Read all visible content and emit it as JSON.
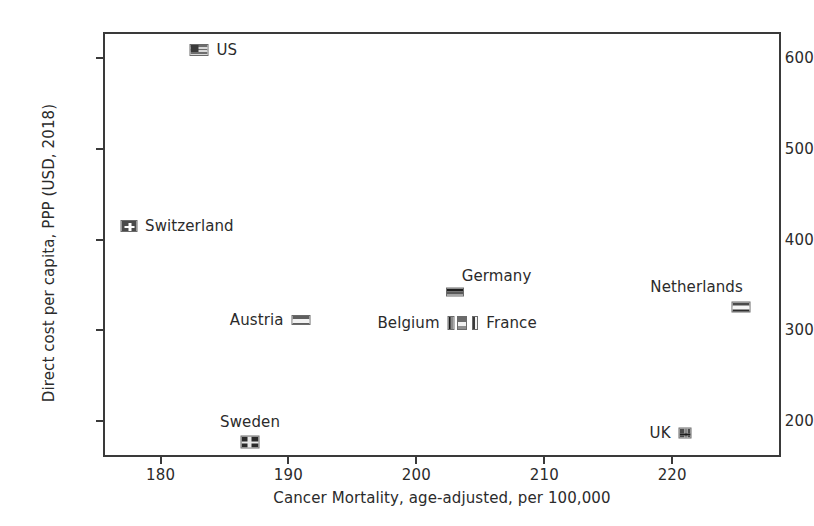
{
  "chart_data": {
    "type": "scatter",
    "title": "",
    "xlabel": "Cancer Mortality, age-adjusted, per 100,000",
    "ylabel": "Direct cost per capita, PPP (USD, 2018)",
    "xlim": [
      175.5,
      228.5
    ],
    "ylim": [
      160,
      629
    ],
    "xticks": [
      180,
      190,
      200,
      210,
      220
    ],
    "yticks": [
      200,
      300,
      400,
      500,
      600
    ],
    "grid": false,
    "legend": "none",
    "marker_style": "country-flag",
    "points": [
      {
        "name": "US",
        "label": "US",
        "x": 183,
        "y": 609,
        "label_pos": "right"
      },
      {
        "name": "Switzerland",
        "label": "Switzerland",
        "x": 177.5,
        "y": 415,
        "label_pos": "right"
      },
      {
        "name": "Germany",
        "label": "Germany",
        "x": 203,
        "y": 342,
        "label_pos": "above-right"
      },
      {
        "name": "Austria",
        "label": "Austria",
        "x": 191,
        "y": 311,
        "label_pos": "left"
      },
      {
        "name": "Belgium",
        "label": "Belgium",
        "x": 202.7,
        "y": 308,
        "label_pos": "left"
      },
      {
        "name": "Luxembourg",
        "label": "",
        "x": 203.6,
        "y": 308,
        "label_pos": "none"
      },
      {
        "name": "France",
        "label": "France",
        "x": 204.6,
        "y": 308,
        "label_pos": "right"
      },
      {
        "name": "Netherlands",
        "label": "Netherlands",
        "x": 225.4,
        "y": 326,
        "label_pos": "above-left"
      },
      {
        "name": "Sweden",
        "label": "Sweden",
        "x": 187,
        "y": 177,
        "label_pos": "above"
      },
      {
        "name": "UK",
        "label": "UK",
        "x": 221,
        "y": 186,
        "label_pos": "left"
      }
    ]
  },
  "axes": {
    "x_tick_labels": [
      "180",
      "190",
      "200",
      "210",
      "220"
    ],
    "y_tick_labels": [
      "200",
      "300",
      "400",
      "500",
      "600"
    ],
    "x_title": "Cancer Mortality, age-adjusted, per 100,000",
    "y_title": "Direct cost per capita, PPP (USD, 2018)"
  },
  "style": {
    "axis_color": "#3a3a3a",
    "text_color": "#2b2b2b",
    "background": "#ffffff"
  }
}
